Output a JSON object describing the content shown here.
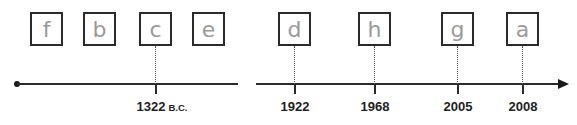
{
  "timeline": {
    "boxes": [
      {
        "letter": "f",
        "x": 30
      },
      {
        "letter": "b",
        "x": 83
      },
      {
        "letter": "c",
        "x": 139
      },
      {
        "letter": "e",
        "x": 192
      },
      {
        "letter": "d",
        "x": 278
      },
      {
        "letter": "h",
        "x": 358
      },
      {
        "letter": "g",
        "x": 441
      },
      {
        "letter": "a",
        "x": 506
      }
    ],
    "events": [
      {
        "year": "1322",
        "era": "B.C.",
        "x": 156
      },
      {
        "year": "1922",
        "era": "",
        "x": 295
      },
      {
        "year": "1968",
        "era": "",
        "x": 375
      },
      {
        "year": "2005",
        "era": "",
        "x": 458
      },
      {
        "year": "2008",
        "era": "",
        "x": 523
      }
    ]
  }
}
